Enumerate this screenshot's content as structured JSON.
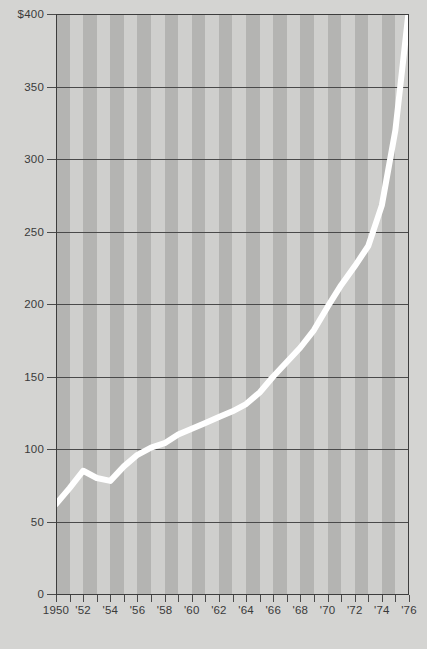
{
  "chart_data": {
    "type": "line",
    "title": "",
    "subtitle": "",
    "xlabel": "",
    "ylabel": "",
    "xlim": [
      1950,
      1976
    ],
    "ylim": [
      0,
      400
    ],
    "grid": true,
    "legend": false,
    "y_ticks": [
      0,
      50,
      100,
      150,
      200,
      250,
      300,
      350,
      400
    ],
    "y_tick_labels": [
      "0",
      "50",
      "100",
      "150",
      "200",
      "250",
      "300",
      "350",
      "$400"
    ],
    "x_ticks": [
      1950,
      1951,
      1952,
      1953,
      1954,
      1955,
      1956,
      1957,
      1958,
      1959,
      1960,
      1961,
      1962,
      1963,
      1964,
      1965,
      1966,
      1967,
      1968,
      1969,
      1970,
      1971,
      1972,
      1973,
      1974,
      1975,
      1976
    ],
    "x_tick_labels": [
      "1950",
      "'52",
      "'54",
      "'56",
      "'58",
      "'60",
      "'62",
      "'64",
      "'66",
      "'68",
      "'70",
      "'72",
      "'74",
      "'76"
    ],
    "x_labeled_years": [
      1950,
      1952,
      1954,
      1956,
      1958,
      1960,
      1962,
      1964,
      1966,
      1968,
      1970,
      1972,
      1974,
      1976
    ],
    "x": [
      1950,
      1951,
      1952,
      1953,
      1954,
      1955,
      1956,
      1957,
      1958,
      1959,
      1960,
      1961,
      1962,
      1963,
      1964,
      1965,
      1966,
      1967,
      1968,
      1969,
      1970,
      1971,
      1972,
      1973,
      1974,
      1975,
      1976
    ],
    "values": [
      62,
      73,
      85,
      80,
      78,
      88,
      96,
      101,
      104,
      110,
      114,
      118,
      122,
      126,
      131,
      139,
      150,
      160,
      170,
      182,
      198,
      213,
      226,
      240,
      268,
      320,
      404
    ],
    "series": [
      {
        "name": "series-1",
        "color": "#ffffff",
        "values": [
          62,
          73,
          85,
          80,
          78,
          88,
          96,
          101,
          104,
          110,
          114,
          118,
          122,
          126,
          131,
          139,
          150,
          160,
          170,
          182,
          198,
          213,
          226,
          240,
          268,
          320,
          404
        ]
      }
    ],
    "colors": {
      "background": "#d4d4d2",
      "plot_background": "#cfcfcd",
      "stripe": "#b4b4b2",
      "gridline": "#4a4a4a",
      "axis": "#3d3d3d",
      "line": "#ffffff",
      "text": "#3a3a3a"
    }
  }
}
